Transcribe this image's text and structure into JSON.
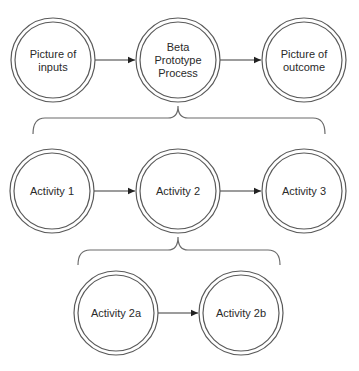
{
  "diagram": {
    "type": "process-decomposition",
    "levels": [
      {
        "name": "level-1",
        "nodes": [
          {
            "id": "inputs",
            "label_lines": [
              "Picture of",
              "inputs"
            ]
          },
          {
            "id": "process",
            "label_lines": [
              "Beta",
              "Prototype",
              "Process"
            ]
          },
          {
            "id": "outcome",
            "label_lines": [
              "Picture of",
              "outcome"
            ]
          }
        ],
        "edges": [
          [
            "inputs",
            "process"
          ],
          [
            "process",
            "outcome"
          ]
        ]
      },
      {
        "name": "level-2",
        "parent": "process",
        "nodes": [
          {
            "id": "activity1",
            "label_lines": [
              "Activity 1"
            ]
          },
          {
            "id": "activity2",
            "label_lines": [
              "Activity 2"
            ]
          },
          {
            "id": "activity3",
            "label_lines": [
              "Activity 3"
            ]
          }
        ],
        "edges": [
          [
            "activity1",
            "activity2"
          ],
          [
            "activity2",
            "activity3"
          ]
        ]
      },
      {
        "name": "level-3",
        "parent": "activity2",
        "nodes": [
          {
            "id": "activity2a",
            "label_lines": [
              "Activity 2a"
            ]
          },
          {
            "id": "activity2b",
            "label_lines": [
              "Activity 2b"
            ]
          }
        ],
        "edges": [
          [
            "activity2a",
            "activity2b"
          ]
        ]
      }
    ]
  }
}
